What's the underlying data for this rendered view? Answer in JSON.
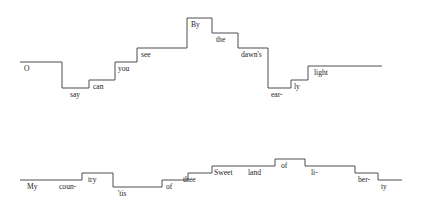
{
  "figure": {
    "type": "pitch-contour",
    "background_color": "#ffffff",
    "line_color": "#3a3a3a",
    "text_color": "#1d1d1d",
    "width": 422,
    "height": 212
  },
  "staves": [
    {
      "name": "staff-upper",
      "lyric_line": "O say can you see By the dawn's ear-ly light",
      "syllables": [
        {
          "text": "O",
          "x0": 20,
          "x1": 62,
          "y": 62,
          "label_x": 24,
          "label_y": 71
        },
        {
          "text": "say",
          "x0": 62,
          "x1": 89,
          "y": 88,
          "label_x": 70,
          "label_y": 97
        },
        {
          "text": "can",
          "x0": 89,
          "x1": 115,
          "y": 80,
          "label_x": 93,
          "label_y": 89
        },
        {
          "text": "you",
          "x0": 115,
          "x1": 137,
          "y": 62,
          "label_x": 118,
          "label_y": 71
        },
        {
          "text": "see",
          "x0": 137,
          "x1": 187,
          "y": 48,
          "label_x": 141,
          "label_y": 57
        },
        {
          "text": "By",
          "x0": 187,
          "x1": 212,
          "y": 18,
          "label_x": 191,
          "label_y": 27
        },
        {
          "text": "the",
          "x0": 212,
          "x1": 238,
          "y": 33,
          "label_x": 216,
          "label_y": 42
        },
        {
          "text": "dawn's",
          "x0": 238,
          "x1": 268,
          "y": 48,
          "label_x": 241,
          "label_y": 57
        },
        {
          "text": "ear-",
          "x0": 268,
          "x1": 291,
          "y": 88,
          "label_x": 271,
          "label_y": 97
        },
        {
          "text": "ly",
          "x0": 291,
          "x1": 308,
          "y": 80,
          "label_x": 294,
          "label_y": 89
        },
        {
          "text": "light",
          "x0": 308,
          "x1": 382,
          "y": 66,
          "label_x": 314,
          "label_y": 75
        }
      ]
    },
    {
      "name": "staff-lower",
      "lyric_line": "My coun-try 'tis of thee Sweet land of li-ber-ty",
      "syllables": [
        {
          "text": "My",
          "x0": 20,
          "x1": 50,
          "y": 180,
          "label_x": 27,
          "label_y": 189
        },
        {
          "text": "coun-",
          "x0": 50,
          "x1": 82,
          "y": 180,
          "label_x": 59,
          "label_y": 189
        },
        {
          "text": "try",
          "x0": 82,
          "x1": 113,
          "y": 173,
          "label_x": 88,
          "label_y": 182
        },
        {
          "text": "'tis",
          "x0": 113,
          "x1": 162,
          "y": 187,
          "label_x": 118,
          "label_y": 196
        },
        {
          "text": "of",
          "x0": 162,
          "x1": 188,
          "y": 180,
          "label_x": 166,
          "label_y": 189
        },
        {
          "text": "thee",
          "x0": 188,
          "x1": 212,
          "y": 173,
          "label_x": 183,
          "label_y": 182
        },
        {
          "text": "Sweet",
          "x0": 212,
          "x1": 245,
          "y": 166,
          "label_x": 214,
          "label_y": 175
        },
        {
          "text": "land",
          "x0": 245,
          "x1": 275,
          "y": 166,
          "label_x": 248,
          "label_y": 175
        },
        {
          "text": "of",
          "x0": 275,
          "x1": 305,
          "y": 159,
          "label_x": 281,
          "label_y": 168
        },
        {
          "text": "li-",
          "x0": 305,
          "x1": 355,
          "y": 166,
          "label_x": 311,
          "label_y": 175
        },
        {
          "text": "ber-",
          "x0": 355,
          "x1": 378,
          "y": 173,
          "label_x": 358,
          "label_y": 182
        },
        {
          "text": "ty",
          "x0": 378,
          "x1": 402,
          "y": 180,
          "label_x": 381,
          "label_y": 189
        }
      ]
    }
  ]
}
